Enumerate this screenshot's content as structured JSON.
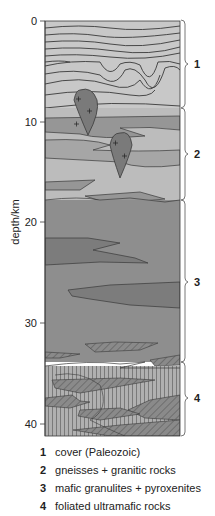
{
  "axis": {
    "label": "depth/km",
    "ticks": [
      {
        "value": "0",
        "y": 21
      },
      {
        "value": "10",
        "y": 122
      },
      {
        "value": "20",
        "y": 222
      },
      {
        "value": "30",
        "y": 323
      },
      {
        "value": "40",
        "y": 424
      }
    ]
  },
  "units": [
    {
      "number": "1",
      "label": "cover (Paleozoic)",
      "top_km": 0,
      "bottom_km": 8.5
    },
    {
      "number": "2",
      "label": "gneisses + granitic rocks",
      "top_km": 8.5,
      "bottom_km": 17.8
    },
    {
      "number": "3",
      "label": "mafic granulites + pyroxenites",
      "top_km": 17.8,
      "bottom_km": 33.8
    },
    {
      "number": "4",
      "label": "foliated ultramafic rocks",
      "top_km": 33.8,
      "bottom_km": 41
    }
  ],
  "colors": {
    "cover": "#c8c8c8",
    "gneiss": "#bcbcbc",
    "gneiss_band": "#969696",
    "granite": "#7a7a7a",
    "mafic": "#8e8e8e",
    "mafic_band": "#7c7c7c",
    "ultramafic": "#a8a8a8",
    "line": "#3a3a3a"
  }
}
